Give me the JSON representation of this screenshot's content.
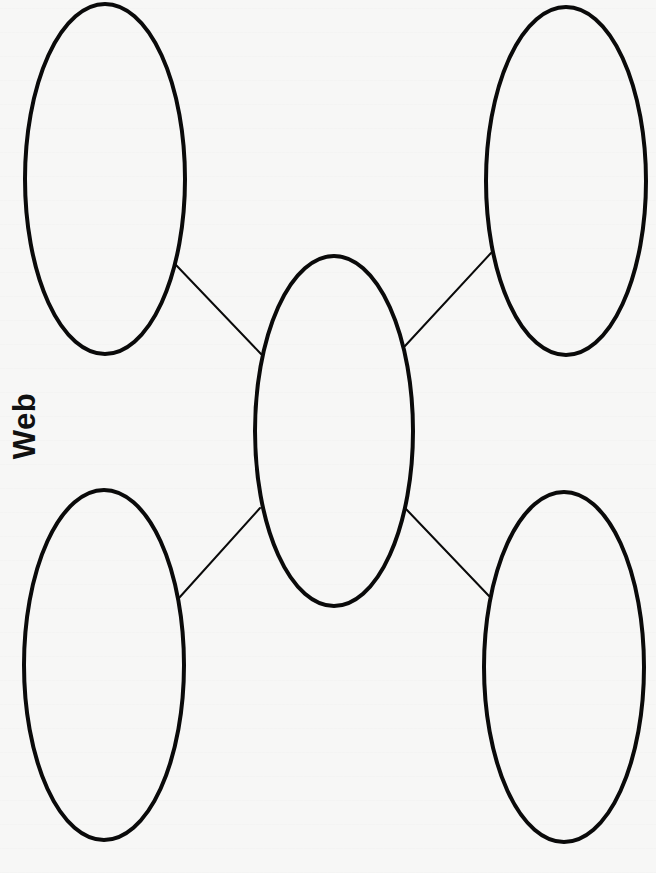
{
  "title": "Web",
  "colors": {
    "paper": "#f7f7f6",
    "stroke": "#0a0a0a",
    "text": "#111111"
  },
  "diagram": {
    "type": "web-graphic-organizer",
    "center_node": {
      "id": "center",
      "cx": 334,
      "cy": 431,
      "rx": 79,
      "ry": 175,
      "text": ""
    },
    "outer_nodes": [
      {
        "id": "top-left",
        "cx": 105,
        "cy": 179,
        "rx": 80,
        "ry": 175,
        "text": ""
      },
      {
        "id": "top-right",
        "cx": 566,
        "cy": 181,
        "rx": 80,
        "ry": 174,
        "text": ""
      },
      {
        "id": "bottom-left",
        "cx": 104,
        "cy": 665,
        "rx": 80,
        "ry": 175,
        "text": ""
      },
      {
        "id": "bottom-right",
        "cx": 564,
        "cy": 667,
        "rx": 80,
        "ry": 175,
        "text": ""
      }
    ],
    "connectors": [
      {
        "from": "top-left",
        "to": "center",
        "x1": 176,
        "y1": 265,
        "x2": 261,
        "y2": 354
      },
      {
        "from": "top-right",
        "to": "center",
        "x1": 491,
        "y1": 253,
        "x2": 405,
        "y2": 346
      },
      {
        "from": "bottom-left",
        "to": "center",
        "x1": 179,
        "y1": 598,
        "x2": 260,
        "y2": 508
      },
      {
        "from": "bottom-right",
        "to": "center",
        "x1": 489,
        "y1": 596,
        "x2": 406,
        "y2": 509
      }
    ]
  }
}
